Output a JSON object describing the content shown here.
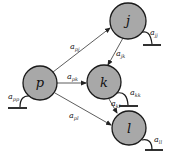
{
  "diagram": {
    "type": "directed-graph",
    "node_color": "#a8a8a8",
    "stroke_color": "#1a1a1a",
    "nodes": [
      {
        "id": "j",
        "label": "j",
        "self_loop": {
          "base": "a",
          "sub": "jj"
        }
      },
      {
        "id": "p",
        "label": "p",
        "self_loop": {
          "base": "a",
          "sub": "pp"
        }
      },
      {
        "id": "k",
        "label": "k",
        "self_loop": {
          "base": "a",
          "sub": "kk"
        }
      },
      {
        "id": "l",
        "label": "l",
        "self_loop": {
          "base": "a",
          "sub": "ll"
        }
      }
    ],
    "edges": [
      {
        "from": "p",
        "to": "j",
        "base": "a",
        "sub": "pj"
      },
      {
        "from": "p",
        "to": "k",
        "base": "a",
        "sub": "pk"
      },
      {
        "from": "p",
        "to": "l",
        "base": "a",
        "sub": "pl"
      },
      {
        "from": "j",
        "to": "k",
        "base": "a",
        "sub": "jk"
      },
      {
        "from": "k",
        "to": "l",
        "base": "a",
        "sub": "kl"
      }
    ]
  }
}
